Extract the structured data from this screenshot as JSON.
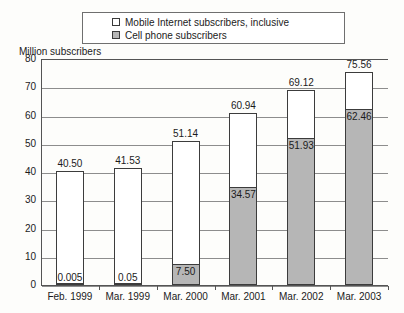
{
  "chart_data": {
    "type": "bar",
    "subtype": "stacked-bar",
    "title": "",
    "xlabel": "",
    "ylabel": "Million subscribers",
    "ylim": [
      0,
      80
    ],
    "ytick_step": 10,
    "yticks": [
      "80",
      "70",
      "60",
      "50",
      "40",
      "30",
      "20",
      "10",
      "0"
    ],
    "grid": "horizontal",
    "legend_position": "top-center",
    "categories": [
      "Feb. 1999",
      "Mar. 1999",
      "Mar. 2000",
      "Mar. 2001",
      "Mar. 2002",
      "Mar. 2003"
    ],
    "series": [
      {
        "name": "Mobile Internet subscribers, inclusive",
        "swatch": "white",
        "color": "#ffffff",
        "values": [
          40.5,
          41.53,
          51.14,
          60.94,
          69.12,
          75.56
        ],
        "labels": [
          "40.50",
          "41.53",
          "51.14",
          "60.94",
          "69.12",
          "75.56"
        ]
      },
      {
        "name": "Cell phone subscribers",
        "swatch": "gray",
        "color": "#b6b6b6",
        "values": [
          0.005,
          0.05,
          7.5,
          34.57,
          51.93,
          62.46
        ],
        "labels": [
          "0.005",
          "0.05",
          "7.50",
          "34.57",
          "51.93",
          "62.46"
        ]
      }
    ]
  },
  "legend": {
    "items": [
      {
        "label": "Mobile Internet subscribers, inclusive"
      },
      {
        "label": "Cell phone subscribers"
      }
    ]
  },
  "axis": {
    "y_title": "Million subscribers"
  },
  "colors": {
    "cell_phone_fill": "#b6b6b6",
    "mobile_internet_fill": "#ffffff",
    "axis_line": "#545454",
    "gridline": "#8d8d8d",
    "bar_outline": "#3c3c3c",
    "text": "#1b1b1b"
  }
}
